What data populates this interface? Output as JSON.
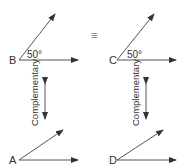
{
  "diagram": {
    "congruent_symbol": "≡",
    "relationship_label": "Complementary",
    "angles": [
      {
        "vertex": "B",
        "measure_label": "50°"
      },
      {
        "vertex": "C",
        "measure_label": "50°"
      },
      {
        "vertex": "A",
        "measure_label": ""
      },
      {
        "vertex": "D",
        "measure_label": ""
      }
    ],
    "colors": {
      "line": "#555555",
      "text": "#333333",
      "background": "#ffffff"
    }
  }
}
